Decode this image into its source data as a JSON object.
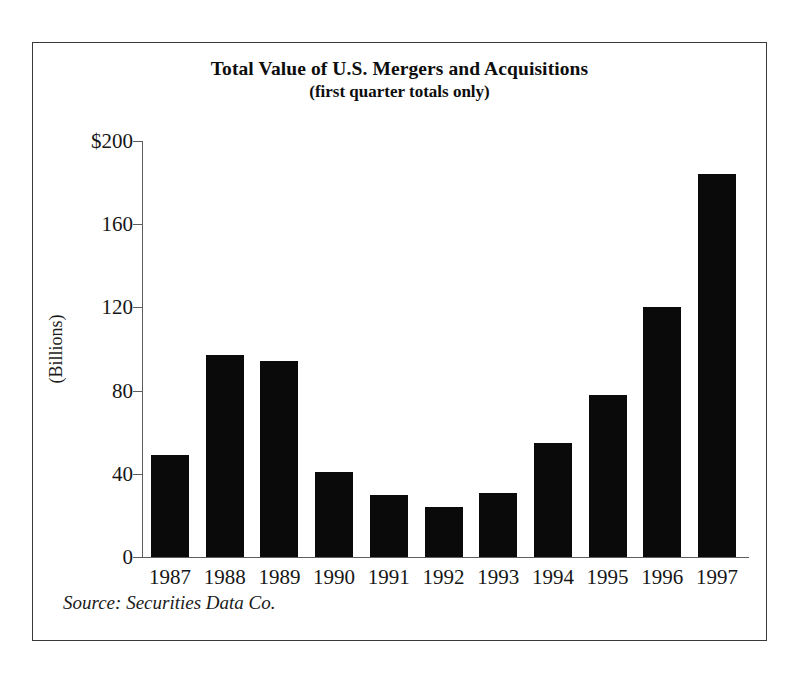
{
  "chart_data": {
    "type": "bar",
    "title": "Total Value of U.S. Mergers and Acquisitions",
    "subtitle": "(first quarter totals only)",
    "xlabel": "",
    "ylabel": "(Billions)",
    "ylim": [
      0,
      200
    ],
    "grid": false,
    "legend": null,
    "categories": [
      "1987",
      "1988",
      "1989",
      "1990",
      "1991",
      "1992",
      "1993",
      "1994",
      "1995",
      "1996",
      "1997"
    ],
    "values": [
      49,
      97,
      94,
      41,
      30,
      24,
      31,
      55,
      78,
      120,
      184
    ],
    "ytick_labels": [
      "$200",
      "160",
      "120",
      "80",
      "40",
      "0"
    ],
    "ytick_values": [
      200,
      160,
      120,
      80,
      40,
      0
    ],
    "bar_color": "#0a0a0a",
    "axis_color": "#5d5d5d",
    "annotations": [
      "Source: Securities Data Co."
    ]
  },
  "figure": {
    "source_note": "Source: Securities Data Co."
  }
}
